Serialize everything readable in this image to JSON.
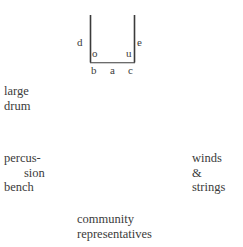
{
  "canvas": {
    "width": 243,
    "height": 247,
    "background": "#ffffff",
    "ink": "#3b3b3b"
  },
  "diagram": {
    "name": "stage-seating-plan",
    "shape": "u-bracket",
    "stroke_color": "#3b3b3b",
    "corner_labels": {
      "d": "d",
      "e": "e",
      "o": "o",
      "u": "u",
      "b": "b",
      "a": "a",
      "c": "c"
    }
  },
  "annotations": {
    "large_drum": {
      "lines": [
        "large",
        "drum"
      ]
    },
    "percussion_bench": {
      "lines": [
        "percus-",
        "sion",
        "bench"
      ]
    },
    "winds_strings": {
      "lines": [
        "winds",
        "&",
        "strings"
      ]
    },
    "community": {
      "lines": [
        "community",
        "representatives"
      ]
    }
  }
}
